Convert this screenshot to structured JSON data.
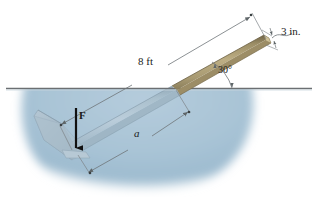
{
  "figure": {
    "type": "engineering-free-body-diagram",
    "background_color": "#ffffff"
  },
  "labels": {
    "length_above": "8 ft",
    "thickness": "3 in.",
    "angle": "30°",
    "submerged_length": "a",
    "force": "F"
  },
  "colors": {
    "water_fill": "#a9c4d6",
    "water_fill_deep": "#9bbacf",
    "waterline": "#6b6f72",
    "rod_wood": "#b3a37a",
    "rod_wood_top": "#8d7f5c",
    "rod_wood_edge": "#6f6346",
    "rod_submerged": "#aabfcb",
    "rod_submerged_top": "#93a9b8",
    "plate": "#9fb3c0",
    "dimension_line": "#6e7578",
    "text": "#1a1a1a",
    "arrow_black": "#111111"
  },
  "geometry": {
    "incline_degrees": 30,
    "waterline_y": 88,
    "waterline_x_start": 6,
    "waterline_x_end": 312,
    "rod_tip_upper": [
      265,
      39
    ],
    "rod_tip_lower": [
      70,
      148
    ],
    "water_surface_crossing": [
      172,
      88
    ]
  },
  "annotations": [
    {
      "name": "length-dimension",
      "value": "8 ft",
      "style": "double-arrow-parallel-to-rod"
    },
    {
      "name": "thickness-dimension",
      "value": "3 in.",
      "style": "leader-with-curve"
    },
    {
      "name": "angle-dimension",
      "value": "30°",
      "style": "arc-with-arrow"
    },
    {
      "name": "submerged-dimension",
      "value": "a",
      "style": "double-arrow-parallel-to-rod"
    },
    {
      "name": "applied-force",
      "value": "F",
      "style": "bold-down-arrow"
    }
  ]
}
